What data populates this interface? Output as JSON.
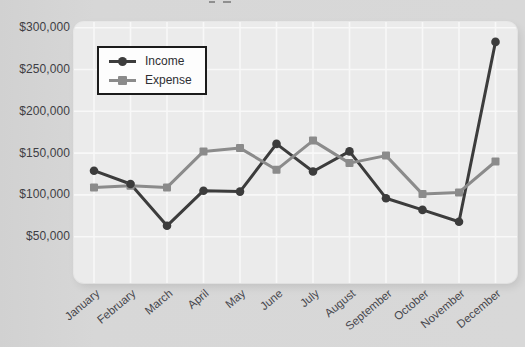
{
  "page": {
    "background_color": "#d7d7d7",
    "plot_background_color": "#ebebeb",
    "gridline_color": "#f8f8f8",
    "axis_text_color": "#46464c"
  },
  "legend": {
    "items": [
      {
        "label": "Income",
        "marker": "circle",
        "color": "#3c3c3c"
      },
      {
        "label": "Expense",
        "marker": "square",
        "color": "#8b8b8b"
      }
    ]
  },
  "chart_data": {
    "type": "line",
    "title": "",
    "xlabel": "",
    "ylabel": "",
    "grid": true,
    "legend_position": "top-left",
    "ylim": [
      0,
      300000
    ],
    "y_tick_step": 50000,
    "categories": [
      "January",
      "February",
      "March",
      "April",
      "May",
      "June",
      "July",
      "August",
      "September",
      "October",
      "November",
      "December"
    ],
    "y_ticks": [
      {
        "value": 300000,
        "label": "$300,000"
      },
      {
        "value": 250000,
        "label": "$250,000"
      },
      {
        "value": 200000,
        "label": "$200,000"
      },
      {
        "value": 150000,
        "label": "$150,000"
      },
      {
        "value": 100000,
        "label": "$100,000"
      },
      {
        "value": 50000,
        "label": "$50,000"
      }
    ],
    "series": [
      {
        "name": "Income",
        "color": "#3c3c3c",
        "marker": "circle",
        "values": [
          129000,
          113000,
          63000,
          105000,
          104000,
          161000,
          128000,
          152000,
          96000,
          82000,
          68000,
          283000
        ]
      },
      {
        "name": "Expense",
        "color": "#8b8b8b",
        "marker": "square",
        "values": [
          109000,
          111000,
          109000,
          152000,
          156000,
          130000,
          165000,
          138000,
          147000,
          101000,
          103000,
          140000
        ]
      }
    ]
  }
}
